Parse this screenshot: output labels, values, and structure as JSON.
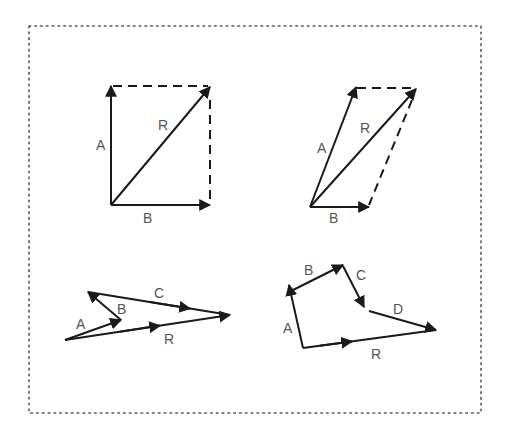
{
  "colors": {
    "background": "#ffffff",
    "stroke": "#1a1a1a",
    "label": "#555555",
    "frame": "#555555"
  },
  "frame": {
    "style": "dotted",
    "x": 29,
    "y": 26,
    "width": 452,
    "height": 387
  },
  "figures": [
    {
      "id": "parallelogram-right-angle",
      "title": "Parallelogram method (perpendicular vectors)",
      "labels": {
        "a": "A",
        "b": "B",
        "r": "R"
      }
    },
    {
      "id": "parallelogram-oblique",
      "title": "Parallelogram method (oblique vectors)",
      "labels": {
        "a": "A",
        "b": "B",
        "r": "R"
      }
    },
    {
      "id": "polygon-three",
      "title": "Polygon method (three vectors)",
      "labels": {
        "a": "A",
        "b": "B",
        "c": "C",
        "r": "R"
      }
    },
    {
      "id": "polygon-four",
      "title": "Polygon method (four vectors)",
      "labels": {
        "a": "A",
        "b": "B",
        "c": "C",
        "d": "D",
        "r": "R"
      }
    }
  ]
}
